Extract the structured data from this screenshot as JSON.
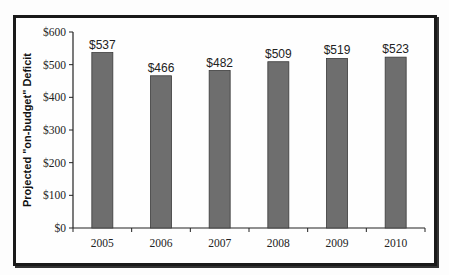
{
  "chart_data": {
    "type": "bar",
    "title": "",
    "xlabel": "",
    "ylabel": "Projected \"on-budget\" Deficit",
    "categories": [
      "2005",
      "2006",
      "2007",
      "2008",
      "2009",
      "2010"
    ],
    "values": [
      537,
      466,
      482,
      509,
      519,
      523
    ],
    "data_labels": [
      "$537",
      "$466",
      "$482",
      "$509",
      "$519",
      "$523"
    ],
    "ylim": [
      0,
      600
    ],
    "yticks": [
      0,
      100,
      200,
      300,
      400,
      500,
      600
    ],
    "ytick_labels": [
      "$0",
      "$100",
      "$200",
      "$300",
      "$400",
      "$500",
      "$600"
    ],
    "bar_color": "#6e6e6e",
    "grid": false,
    "legend": "none"
  }
}
